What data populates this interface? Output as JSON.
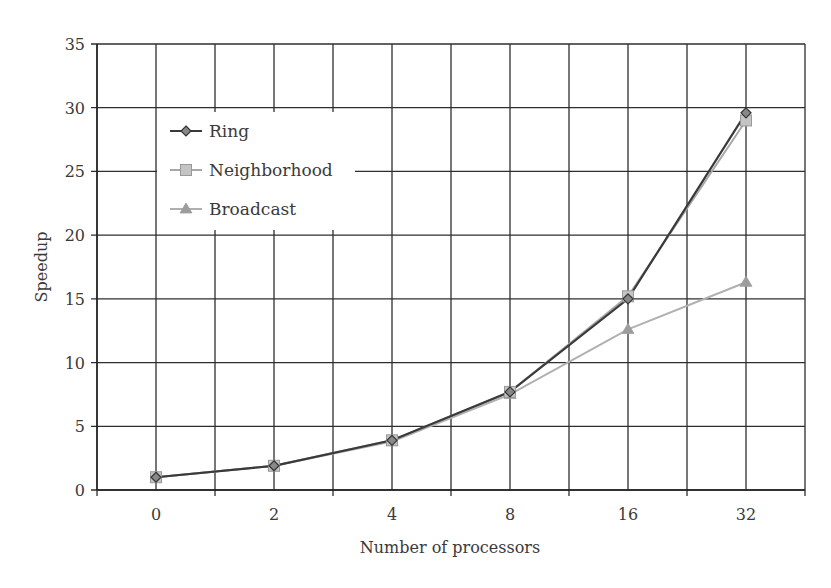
{
  "chart_data": {
    "type": "line",
    "title": "",
    "xlabel": "Number of processors",
    "ylabel": "Speedup",
    "categories": [
      "0",
      "2",
      "4",
      "8",
      "16",
      "32"
    ],
    "ylim": [
      0,
      35
    ],
    "yticks": [
      0,
      5,
      10,
      15,
      20,
      25,
      30,
      35
    ],
    "grid": true,
    "legend_position": "upper-left-inside",
    "series": [
      {
        "name": "Ring",
        "marker": "diamond",
        "color": "#3a3a3a",
        "values": [
          1.0,
          1.9,
          3.9,
          7.7,
          15.0,
          29.6
        ]
      },
      {
        "name": "Neighborhood",
        "marker": "square",
        "color": "#a8a8a8",
        "values": [
          1.0,
          1.9,
          3.9,
          7.7,
          15.2,
          29.0
        ]
      },
      {
        "name": "Broadcast",
        "marker": "triangle",
        "color": "#b0b0b0",
        "values": [
          1.0,
          1.9,
          3.8,
          7.5,
          12.6,
          16.3
        ]
      }
    ]
  }
}
